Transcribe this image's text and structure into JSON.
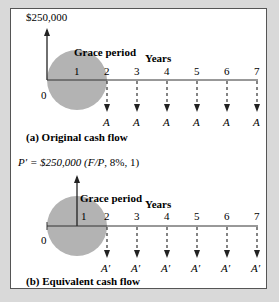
{
  "diagram": {
    "panel_a": {
      "initial_amount": "$250,000",
      "grace_label": "Grace period",
      "axis_label": "Years",
      "origin": "0",
      "ticks": [
        "1",
        "2",
        "3",
        "4",
        "5",
        "6",
        "7"
      ],
      "payment_label": "A",
      "caption": "(a) Original cash flow"
    },
    "panel_b": {
      "formula_prefix": "P′ = $250,000 (",
      "formula_italic": "F/P",
      "formula_suffix": ", 8%, 1)",
      "grace_label": "Grace period",
      "axis_label": "Years",
      "origin": "0",
      "ticks": [
        "1",
        "2",
        "3",
        "4",
        "5",
        "6",
        "7"
      ],
      "payment_label": "A′",
      "caption": "(b) Equivalent cash flow"
    },
    "colors": {
      "circle": "#b3b3b3",
      "line": "#333333",
      "background": "#d9d9d9"
    }
  }
}
